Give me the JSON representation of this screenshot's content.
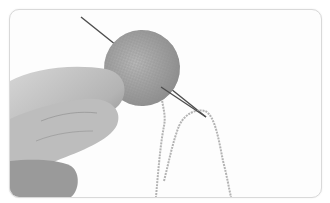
{
  "image": {
    "description": "Grayscale photo of a hand holding a small knitted oval piece with a yarn needle threaded through it and loose yarn strands hanging down",
    "colors": {
      "background": "#fdfdfd",
      "border": "#d9d9d9",
      "skin_light": "#cfcfcf",
      "skin_dark": "#8a8a8a",
      "knit": "#a9a9a9",
      "needle": "#555555",
      "yarn": "#b5b5b5"
    }
  }
}
